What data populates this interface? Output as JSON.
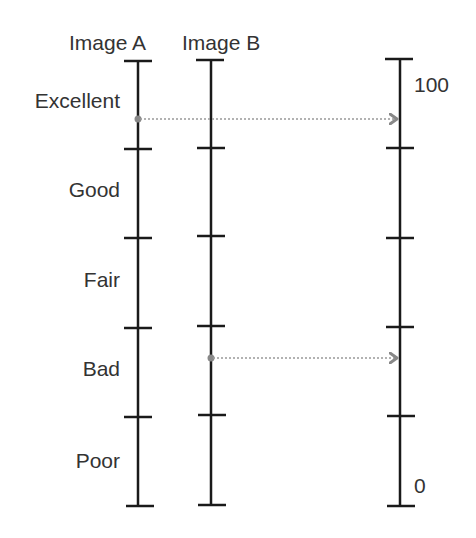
{
  "diagram": {
    "type": "rating-scale-mapping",
    "headers": {
      "image_a": "Image A",
      "image_b": "Image B"
    },
    "categories": [
      "Excellent",
      "Good",
      "Fair",
      "Bad",
      "Poor"
    ],
    "continuous_scale": {
      "max_label": "100",
      "min_label": "0"
    },
    "mappings": [
      {
        "from": "Image A",
        "category": "Excellent",
        "to": "continuous scale"
      },
      {
        "from": "Image B",
        "category": "Bad",
        "to": "continuous scale"
      }
    ],
    "colors": {
      "axis": "#1a1a1a",
      "arrow": "#888888"
    }
  }
}
